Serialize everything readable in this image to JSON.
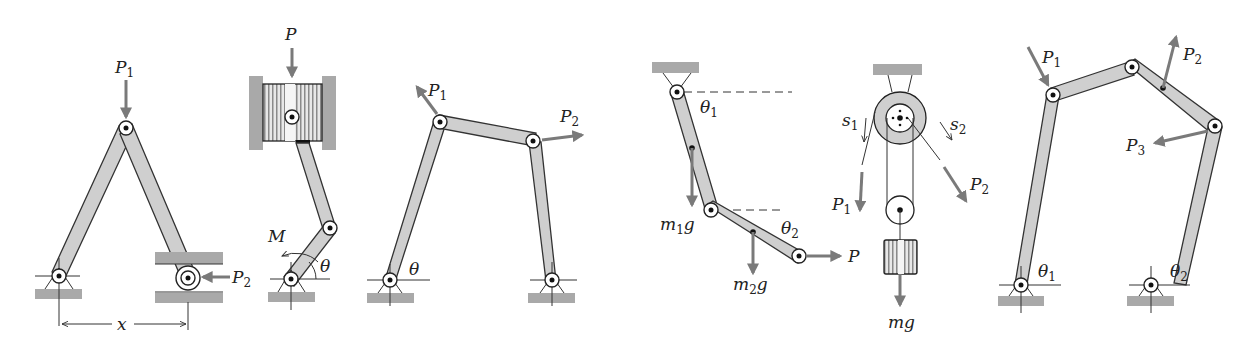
{
  "figure": {
    "panels": [
      {
        "id": "a",
        "title": "A-frame two-link with slider",
        "labels": {
          "top_force": "P",
          "top_force_sub": "1",
          "side_force": "P",
          "side_force_sub": "2",
          "dimension": "x"
        }
      },
      {
        "id": "b",
        "title": "Piston-crank",
        "labels": {
          "piston_force": "P",
          "moment": "M",
          "angle": "θ"
        }
      },
      {
        "id": "c",
        "title": "Four-bar linkage",
        "labels": {
          "force1": "P",
          "force1_sub": "1",
          "force2": "P",
          "force2_sub": "2",
          "angle": "θ"
        }
      },
      {
        "id": "d",
        "title": "Double pendulum",
        "labels": {
          "angle1": "θ",
          "angle1_sub": "1",
          "angle2": "θ",
          "angle2_sub": "2",
          "weight1": "m",
          "weight1_sub": "1",
          "weight1_g": "g",
          "weight2": "m",
          "weight2_sub": "2",
          "weight2_g": "g",
          "force": "P"
        }
      },
      {
        "id": "e",
        "title": "Pulley system",
        "labels": {
          "s1": "s",
          "s1_sub": "1",
          "s2": "s",
          "s2_sub": "2",
          "force1": "P",
          "force1_sub": "1",
          "force2": "P",
          "force2_sub": "2",
          "weight": "mg"
        }
      },
      {
        "id": "f",
        "title": "Five-bar linkage",
        "labels": {
          "force1": "P",
          "force1_sub": "1",
          "force2": "P",
          "force2_sub": "2",
          "force3": "P",
          "force3_sub": "3",
          "angle1": "θ",
          "angle1_sub": "1",
          "angle2": "θ",
          "angle2_sub": "2"
        }
      }
    ]
  }
}
